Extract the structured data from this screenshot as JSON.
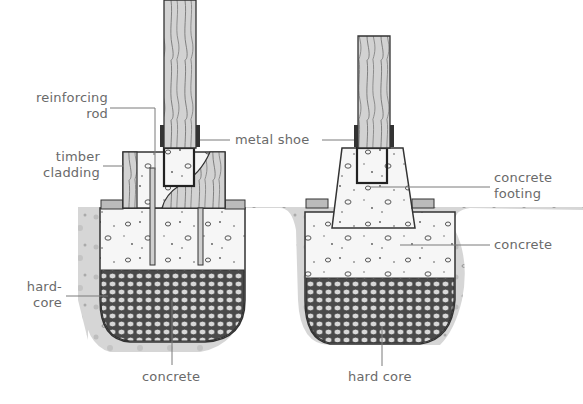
{
  "diagram": {
    "colors": {
      "ink": "#3a3a3a",
      "leader": "#7a7a7a",
      "label": "#6a6a6a",
      "soil": "#d4d4d4",
      "concrete": "#f4f4f4",
      "hardcore": "#5a5a5a",
      "timber": "#cfcfcf"
    },
    "left_footing": {
      "labels": {
        "reinforcing_rod_1": "reinforcing",
        "reinforcing_rod_2": "rod",
        "timber_cladding_1": "timber",
        "timber_cladding_2": "cladding",
        "hard_core_1": "hard-",
        "hard_core_2": "core",
        "concrete": "concrete"
      }
    },
    "shared": {
      "metal_shoe": "metal shoe"
    },
    "right_footing": {
      "labels": {
        "concrete_footing_1": "concrete",
        "concrete_footing_2": "footing",
        "concrete": "concrete",
        "hard_core": "hard core"
      }
    }
  }
}
